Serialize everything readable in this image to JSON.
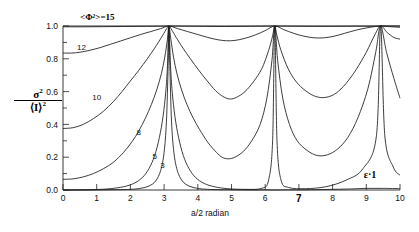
{
  "chart_data": {
    "type": "line",
    "title_raw": "<Φ²>=15",
    "xlabel": "a/2 radian",
    "ylabel": "σ² / ⟨I⟩²",
    "ylabel_numerator": "σ",
    "ylabel_numerator_sup": "2",
    "ylabel_denominator": "⟨I⟩",
    "ylabel_denominator_sup": "2",
    "annotation": "ε = 1",
    "annotation_raw": "ε·1",
    "xlim": [
      0,
      10
    ],
    "ylim": [
      0.0,
      1.0
    ],
    "grid": false,
    "legend": "inline-curve-labels",
    "xticks": [
      0,
      1,
      2,
      3,
      4,
      5,
      6,
      7,
      8,
      9,
      10
    ],
    "xtick_labels": [
      "0",
      "1",
      "2",
      "3",
      "4",
      "5",
      "6",
      "7",
      "8",
      "9",
      "10"
    ],
    "yticks": [
      0.0,
      0.2,
      0.4,
      0.6,
      0.8,
      1.0
    ],
    "ytick_labels": [
      "0.0",
      "0.2",
      "0.4",
      "0.6",
      "0.8",
      "1.0"
    ],
    "ytick_minor": [
      0.1,
      0.3,
      0.5,
      0.7,
      0.9
    ],
    "peak_positions": [
      3.14159,
      6.28319,
      9.42478
    ],
    "series": [
      {
        "name": "3",
        "label": "3",
        "label_x": 2.95,
        "label_y": 0.155,
        "values": [
          [
            0.0,
            0.0
          ],
          [
            0.4,
            0.0
          ],
          [
            0.8,
            0.0
          ],
          [
            1.2,
            0.001
          ],
          [
            1.6,
            0.002
          ],
          [
            2.0,
            0.004
          ],
          [
            2.3,
            0.01
          ],
          [
            2.55,
            0.024
          ],
          [
            2.75,
            0.055
          ],
          [
            2.9,
            0.12
          ],
          [
            3.0,
            0.23
          ],
          [
            3.07,
            0.42
          ],
          [
            3.12,
            0.76
          ],
          [
            3.14159,
            1.0
          ],
          [
            3.17,
            0.76
          ],
          [
            3.22,
            0.42
          ],
          [
            3.29,
            0.23
          ],
          [
            3.39,
            0.12
          ],
          [
            3.54,
            0.055
          ],
          [
            3.74,
            0.024
          ],
          [
            3.99,
            0.01
          ],
          [
            4.29,
            0.004
          ],
          [
            4.7,
            0.002
          ],
          [
            5.2,
            0.001
          ],
          [
            5.7,
            0.0
          ],
          [
            6.0,
            0.001
          ],
          [
            6.3,
            0.0
          ],
          [
            6.6,
            0.001
          ],
          [
            7.0,
            0.001
          ],
          [
            7.5,
            0.002
          ],
          [
            8.0,
            0.004
          ],
          [
            8.5,
            0.006
          ],
          [
            9.0,
            0.01
          ],
          [
            9.5,
            0.01
          ],
          [
            10.0,
            0.008
          ]
        ]
      },
      {
        "name": "5",
        "label": "5",
        "label_x": 2.72,
        "label_y": 0.205,
        "values": [
          [
            0.0,
            0.0
          ],
          [
            0.5,
            0.001
          ],
          [
            1.0,
            0.003
          ],
          [
            1.4,
            0.008
          ],
          [
            1.8,
            0.02
          ],
          [
            2.1,
            0.04
          ],
          [
            2.35,
            0.075
          ],
          [
            2.55,
            0.13
          ],
          [
            2.72,
            0.21
          ],
          [
            2.86,
            0.32
          ],
          [
            2.97,
            0.45
          ],
          [
            3.05,
            0.6
          ],
          [
            3.1,
            0.76
          ],
          [
            3.14159,
            1.0
          ],
          [
            3.19,
            0.76
          ],
          [
            3.24,
            0.6
          ],
          [
            3.32,
            0.45
          ],
          [
            3.43,
            0.32
          ],
          [
            3.57,
            0.21
          ],
          [
            3.74,
            0.13
          ],
          [
            3.94,
            0.075
          ],
          [
            4.19,
            0.04
          ],
          [
            4.49,
            0.02
          ],
          [
            4.89,
            0.008
          ],
          [
            5.4,
            0.004
          ],
          [
            5.9,
            0.01
          ],
          [
            6.1,
            0.06
          ],
          [
            6.22,
            0.3
          ],
          [
            6.28319,
            1.0
          ],
          [
            6.35,
            0.3
          ],
          [
            6.47,
            0.06
          ],
          [
            6.7,
            0.015
          ],
          [
            7.2,
            0.008
          ],
          [
            7.8,
            0.02
          ],
          [
            8.4,
            0.06
          ],
          [
            8.9,
            0.13
          ],
          [
            9.3,
            0.33
          ],
          [
            9.42478,
            1.0
          ],
          [
            9.55,
            0.33
          ],
          [
            9.8,
            0.14
          ],
          [
            10.0,
            0.09
          ]
        ]
      },
      {
        "name": "8",
        "label": "8",
        "label_x": 2.25,
        "label_y": 0.355,
        "values": [
          [
            0.0,
            0.065
          ],
          [
            0.3,
            0.068
          ],
          [
            0.6,
            0.08
          ],
          [
            0.9,
            0.1
          ],
          [
            1.2,
            0.13
          ],
          [
            1.5,
            0.17
          ],
          [
            1.8,
            0.23
          ],
          [
            2.05,
            0.295
          ],
          [
            2.25,
            0.36
          ],
          [
            2.45,
            0.44
          ],
          [
            2.62,
            0.52
          ],
          [
            2.78,
            0.61
          ],
          [
            2.92,
            0.71
          ],
          [
            3.02,
            0.81
          ],
          [
            3.1,
            0.92
          ],
          [
            3.14159,
            1.0
          ],
          [
            3.2,
            0.92
          ],
          [
            3.28,
            0.81
          ],
          [
            3.38,
            0.71
          ],
          [
            3.52,
            0.61
          ],
          [
            3.68,
            0.52
          ],
          [
            3.86,
            0.44
          ],
          [
            4.05,
            0.37
          ],
          [
            4.3,
            0.29
          ],
          [
            4.55,
            0.23
          ],
          [
            4.72,
            0.2
          ],
          [
            4.9,
            0.19
          ],
          [
            5.1,
            0.2
          ],
          [
            5.35,
            0.235
          ],
          [
            5.6,
            0.3
          ],
          [
            5.85,
            0.4
          ],
          [
            6.05,
            0.56
          ],
          [
            6.2,
            0.79
          ],
          [
            6.28319,
            1.0
          ],
          [
            6.37,
            0.79
          ],
          [
            6.52,
            0.56
          ],
          [
            6.72,
            0.4
          ],
          [
            6.95,
            0.3
          ],
          [
            7.25,
            0.24
          ],
          [
            7.55,
            0.21
          ],
          [
            7.85,
            0.215
          ],
          [
            8.15,
            0.25
          ],
          [
            8.45,
            0.32
          ],
          [
            8.75,
            0.44
          ],
          [
            9.05,
            0.62
          ],
          [
            9.28,
            0.84
          ],
          [
            9.42478,
            1.0
          ],
          [
            9.6,
            0.84
          ],
          [
            9.82,
            0.68
          ],
          [
            10.0,
            0.56
          ]
        ]
      },
      {
        "name": "10",
        "label": "10",
        "label_x": 1.0,
        "label_y": 0.565,
        "values": [
          [
            0.0,
            0.375
          ],
          [
            0.3,
            0.38
          ],
          [
            0.6,
            0.4
          ],
          [
            0.9,
            0.435
          ],
          [
            1.2,
            0.48
          ],
          [
            1.5,
            0.54
          ],
          [
            1.75,
            0.6
          ],
          [
            2.0,
            0.665
          ],
          [
            2.25,
            0.73
          ],
          [
            2.5,
            0.8
          ],
          [
            2.72,
            0.865
          ],
          [
            2.92,
            0.93
          ],
          [
            3.05,
            0.975
          ],
          [
            3.14159,
            1.0
          ],
          [
            3.23,
            0.975
          ],
          [
            3.36,
            0.93
          ],
          [
            3.56,
            0.865
          ],
          [
            3.78,
            0.8
          ],
          [
            4.03,
            0.73
          ],
          [
            4.28,
            0.665
          ],
          [
            4.53,
            0.605
          ],
          [
            4.75,
            0.57
          ],
          [
            4.95,
            0.555
          ],
          [
            5.15,
            0.565
          ],
          [
            5.4,
            0.6
          ],
          [
            5.65,
            0.66
          ],
          [
            5.9,
            0.74
          ],
          [
            6.1,
            0.85
          ],
          [
            6.22,
            0.94
          ],
          [
            6.28319,
            1.0
          ],
          [
            6.35,
            0.94
          ],
          [
            6.47,
            0.85
          ],
          [
            6.68,
            0.74
          ],
          [
            6.92,
            0.66
          ],
          [
            7.2,
            0.605
          ],
          [
            7.5,
            0.57
          ],
          [
            7.8,
            0.565
          ],
          [
            8.1,
            0.59
          ],
          [
            8.4,
            0.65
          ],
          [
            8.7,
            0.735
          ],
          [
            9.0,
            0.84
          ],
          [
            9.25,
            0.945
          ],
          [
            9.42478,
            1.0
          ],
          [
            9.62,
            0.96
          ],
          [
            9.82,
            0.93
          ],
          [
            10.0,
            0.92
          ]
        ]
      },
      {
        "name": "12",
        "label": "12",
        "label_x": 0.55,
        "label_y": 0.875,
        "values": [
          [
            0.0,
            0.835
          ],
          [
            0.25,
            0.835
          ],
          [
            0.5,
            0.84
          ],
          [
            0.8,
            0.852
          ],
          [
            1.1,
            0.868
          ],
          [
            1.4,
            0.888
          ],
          [
            1.7,
            0.908
          ],
          [
            2.0,
            0.928
          ],
          [
            2.3,
            0.948
          ],
          [
            2.6,
            0.966
          ],
          [
            2.9,
            0.984
          ],
          [
            3.14159,
            1.0
          ],
          [
            3.4,
            0.984
          ],
          [
            3.7,
            0.966
          ],
          [
            4.0,
            0.948
          ],
          [
            4.3,
            0.93
          ],
          [
            4.6,
            0.916
          ],
          [
            4.85,
            0.91
          ],
          [
            5.1,
            0.912
          ],
          [
            5.4,
            0.925
          ],
          [
            5.7,
            0.945
          ],
          [
            6.0,
            0.972
          ],
          [
            6.28319,
            1.0
          ],
          [
            6.55,
            0.978
          ],
          [
            6.85,
            0.955
          ],
          [
            7.15,
            0.938
          ],
          [
            7.45,
            0.928
          ],
          [
            7.75,
            0.928
          ],
          [
            8.05,
            0.938
          ],
          [
            8.35,
            0.955
          ],
          [
            8.7,
            0.975
          ],
          [
            9.05,
            0.99
          ],
          [
            9.42478,
            1.0
          ],
          [
            9.7,
            0.996
          ],
          [
            10.0,
            0.992
          ]
        ]
      },
      {
        "name": "15",
        "label": "15",
        "label_x": 0.15,
        "label_y": 1.0,
        "values": [
          [
            0.0,
            0.995
          ],
          [
            0.6,
            0.995
          ],
          [
            1.2,
            0.996
          ],
          [
            1.8,
            0.997
          ],
          [
            2.4,
            0.998
          ],
          [
            3.0,
            0.999
          ],
          [
            3.14159,
            1.0
          ],
          [
            3.6,
            0.999
          ],
          [
            4.2,
            0.998
          ],
          [
            4.8,
            0.997
          ],
          [
            5.4,
            0.998
          ],
          [
            6.0,
            0.999
          ],
          [
            6.28319,
            1.0
          ],
          [
            6.8,
            0.999
          ],
          [
            7.4,
            0.998
          ],
          [
            8.0,
            0.998
          ],
          [
            8.6,
            0.999
          ],
          [
            9.2,
            0.999
          ],
          [
            9.42478,
            1.0
          ],
          [
            10.0,
            1.0
          ]
        ]
      }
    ]
  }
}
